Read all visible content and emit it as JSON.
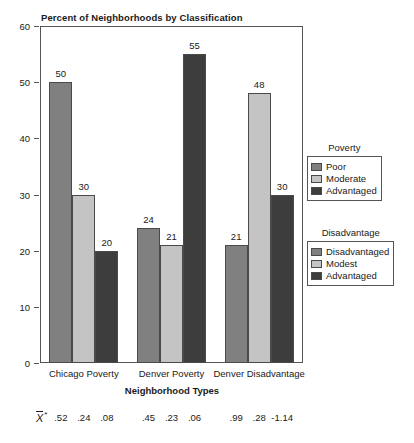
{
  "chart_data": {
    "type": "bar",
    "title": "Percent of Neighborhoods by Classification",
    "xlabel": "Neighborhood Types",
    "ylabel": "",
    "ylim": [
      0,
      60
    ],
    "yticks": [
      0,
      10,
      20,
      30,
      40,
      50,
      60
    ],
    "grid": false,
    "categories": [
      "Chicago Poverty",
      "Denver Poverty",
      "Denver Disadvantage"
    ],
    "series": [
      {
        "name": "First",
        "values": [
          50,
          24,
          21
        ],
        "color": "#808080"
      },
      {
        "name": "Second",
        "values": [
          30,
          21,
          48
        ],
        "color": "#c4c4c4"
      },
      {
        "name": "Third",
        "values": [
          20,
          55,
          30
        ],
        "color": "#3d3d3d"
      }
    ],
    "bar_value_labels": [
      [
        "50",
        "30",
        "20"
      ],
      [
        "24",
        "21",
        "55"
      ],
      [
        "21",
        "48",
        "30"
      ]
    ],
    "annotations": {
      "mean_symbol_letter": "X",
      "mean_symbol_star": "*",
      "mean_values": [
        [
          ".52",
          ".24",
          ".08"
        ],
        [
          ".45",
          ".23",
          ".06"
        ],
        [
          ".99",
          ".28",
          "-1.14"
        ]
      ]
    }
  },
  "legends": [
    {
      "id": "poverty",
      "title": "Poverty",
      "entries": [
        {
          "label": "Poor",
          "color": "#808080"
        },
        {
          "label": "Moderate",
          "color": "#c4c4c4"
        },
        {
          "label": "Advantaged",
          "color": "#3d3d3d"
        }
      ]
    },
    {
      "id": "disadvantage",
      "title": "Disadvantage",
      "entries": [
        {
          "label": "Disadvantaged",
          "color": "#808080"
        },
        {
          "label": "Modest",
          "color": "#c4c4c4"
        },
        {
          "label": "Advantaged",
          "color": "#3d3d3d"
        }
      ]
    }
  ]
}
